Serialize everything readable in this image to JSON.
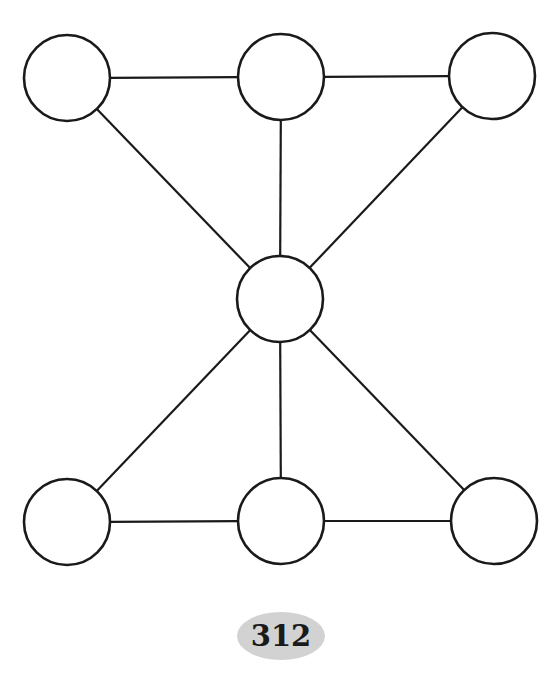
{
  "diagram": {
    "type": "graph",
    "stroke_color": "#1a1a1a",
    "node_fill": "#ffffff",
    "nodes": [
      {
        "id": "top-left",
        "cx": 67,
        "cy": 78,
        "r": 43,
        "label": ""
      },
      {
        "id": "top-middle",
        "cx": 281,
        "cy": 77,
        "r": 43,
        "label": ""
      },
      {
        "id": "top-right",
        "cx": 492,
        "cy": 76,
        "r": 43,
        "label": ""
      },
      {
        "id": "center",
        "cx": 280,
        "cy": 299,
        "r": 43,
        "label": ""
      },
      {
        "id": "bottom-left",
        "cx": 67,
        "cy": 522,
        "r": 43,
        "label": ""
      },
      {
        "id": "bottom-middle",
        "cx": 281,
        "cy": 521,
        "r": 43,
        "label": ""
      },
      {
        "id": "bottom-right",
        "cx": 494,
        "cy": 521,
        "r": 43,
        "label": ""
      }
    ],
    "edges": [
      [
        "top-left",
        "top-middle"
      ],
      [
        "top-middle",
        "top-right"
      ],
      [
        "top-left",
        "center"
      ],
      [
        "top-middle",
        "center"
      ],
      [
        "top-right",
        "center"
      ],
      [
        "center",
        "bottom-left"
      ],
      [
        "center",
        "bottom-middle"
      ],
      [
        "center",
        "bottom-right"
      ],
      [
        "bottom-left",
        "bottom-middle"
      ],
      [
        "bottom-middle",
        "bottom-right"
      ]
    ]
  },
  "page_number": {
    "text": "312",
    "fill": "#d2d2d2"
  }
}
